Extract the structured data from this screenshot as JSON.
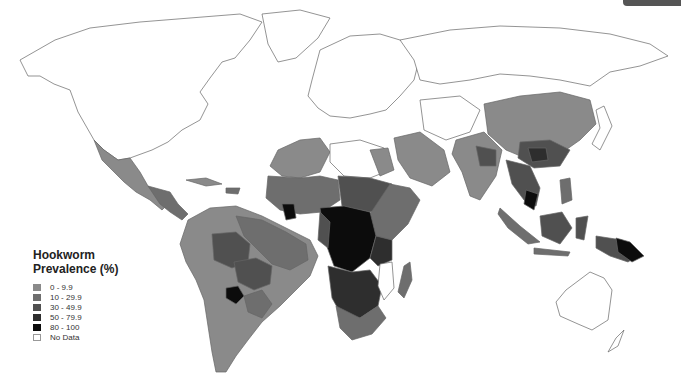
{
  "map": {
    "title": "Hookworm Prevalence (%)",
    "legend": {
      "title_line1": "Hookworm",
      "title_line2": "Prevalence (%)",
      "items": [
        {
          "label": "0 - 9.9",
          "color": "#8a8a8a"
        },
        {
          "label": "10 - 29.9",
          "color": "#6e6e6e"
        },
        {
          "label": "30 - 49.9",
          "color": "#505050"
        },
        {
          "label": "50 - 79.9",
          "color": "#2e2e2e"
        },
        {
          "label": "80 - 100",
          "color": "#0c0c0c"
        },
        {
          "label": "No Data",
          "color": "#ffffff"
        }
      ]
    },
    "colors": {
      "c0": "#8a8a8a",
      "c1": "#6e6e6e",
      "c2": "#505050",
      "c3": "#2e2e2e",
      "c4": "#0c0c0c",
      "nodata": "#ffffff",
      "outline": "#666666"
    }
  }
}
